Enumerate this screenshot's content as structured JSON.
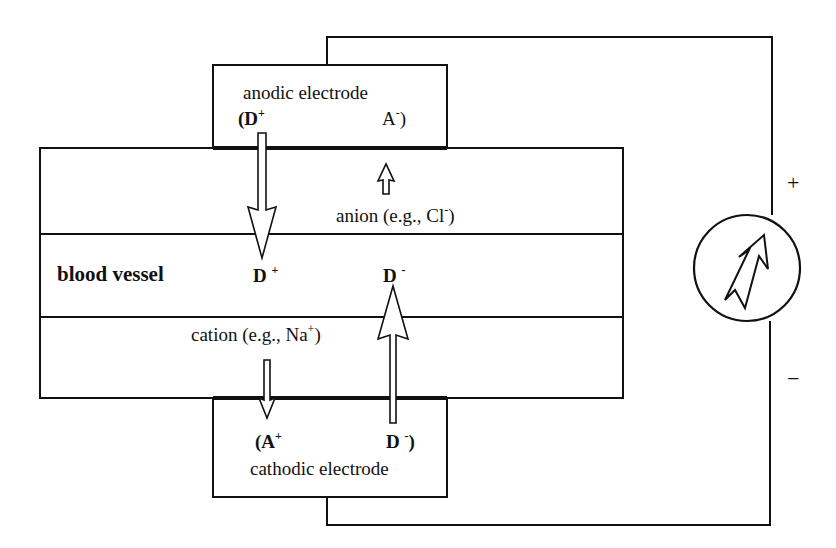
{
  "diagram": {
    "anode": {
      "label": "anodic electrode",
      "left": "(D",
      "left_sup": "+",
      "right": "A",
      "right_sup": "-",
      "right_close": ")"
    },
    "cathode": {
      "label": "cathodic electrode",
      "left": "(A",
      "left_sup": "+",
      "right": "D",
      "right_sup": "-",
      "right_close": ")"
    },
    "vessel": {
      "label": "blood vessel",
      "d_plus": "D",
      "d_plus_sup": "+",
      "d_minus": "D",
      "d_minus_sup": "-"
    },
    "anion": {
      "text": "anion (e.g., Cl",
      "sup": "-",
      "close": ")"
    },
    "cation": {
      "text": "cation (e.g., Na",
      "sup": "+",
      "close": ")"
    },
    "source": {
      "plus": "+",
      "minus": "−"
    }
  }
}
